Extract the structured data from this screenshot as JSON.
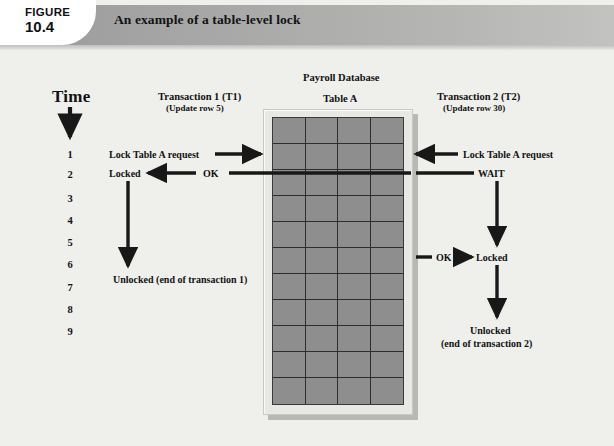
{
  "header": {
    "figure_label": "FIGURE",
    "figure_number": "10.4",
    "title": "An example of a table-level lock"
  },
  "diagram": {
    "time_axis": {
      "label": "Time",
      "ticks": [
        "1",
        "2",
        "3",
        "4",
        "5",
        "6",
        "7",
        "8",
        "9"
      ]
    },
    "transaction1": {
      "title": "Transaction 1 (T1)",
      "subtitle": "(Update row 5)",
      "events": [
        {
          "time": "1",
          "label": "Lock Table A request",
          "direction": "to-table"
        },
        {
          "time": "2",
          "label": "Locked",
          "message": "OK",
          "direction": "from-table"
        },
        {
          "time": "6",
          "label": "Unlocked (end of transaction 1)",
          "direction": "none"
        }
      ]
    },
    "transaction2": {
      "title": "Transaction 2 (T2)",
      "subtitle": "(Update row 30)",
      "events": [
        {
          "time": "1",
          "label": "Lock Table A request",
          "direction": "to-table"
        },
        {
          "time": "2",
          "label": "WAIT",
          "direction": "from-table"
        },
        {
          "time": "6",
          "label": "Locked",
          "message": "OK",
          "direction": "from-table"
        },
        {
          "time": "9",
          "label": "Unlocked",
          "label2": "(end of transaction 2)",
          "direction": "none"
        }
      ]
    },
    "database": {
      "name": "Payroll Database",
      "table_name": "Table A",
      "grid_columns": 4,
      "grid_rows": 11
    },
    "colors": {
      "background": "#efefec",
      "header_band": "#a8a8a6",
      "table_cell": "#8e8e8e",
      "table_frame": "#e8e8e5",
      "ink": "#121212"
    }
  }
}
